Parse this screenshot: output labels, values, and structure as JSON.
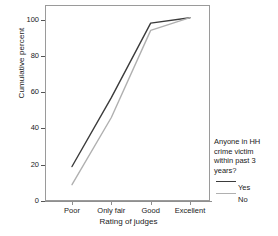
{
  "chart_data": {
    "type": "line",
    "title": "",
    "subtitle": "",
    "xlabel": "Rating of judges",
    "ylabel": "Cumulative percent",
    "categories": [
      "Poor",
      "Only fair",
      "Good",
      "Excellent"
    ],
    "series": [
      {
        "name": "Yes",
        "values": [
          19,
          57,
          98,
          101
        ],
        "color": "#3b3b3b"
      },
      {
        "name": "No",
        "values": [
          9,
          46,
          94,
          101
        ],
        "color": "#b0b0b0"
      }
    ],
    "ylim": [
      0,
      108
    ],
    "yticks": [
      0,
      20,
      40,
      60,
      80,
      100
    ],
    "ytick_labels": [
      "0",
      "20",
      "40",
      "60",
      "80",
      "100"
    ],
    "xlim": [
      0,
      3
    ],
    "grid": false,
    "legend_position": "right",
    "legend": {
      "title": "Anyone in HH\ncrime victim\nwithin past 3\nyears?",
      "entries": [
        "Yes",
        "No"
      ]
    }
  },
  "axis": {
    "y_title": "Cumulative percent",
    "x_title": "Rating of judges",
    "y_ticks": [
      {
        "label": "100",
        "value": 100
      },
      {
        "label": "80",
        "value": 80
      },
      {
        "label": "60",
        "value": 60
      },
      {
        "label": "40",
        "value": 40
      },
      {
        "label": "20",
        "value": 20
      },
      {
        "label": "0",
        "value": 0
      }
    ],
    "x_ticks": [
      {
        "label": "Poor"
      },
      {
        "label": "Only fair"
      },
      {
        "label": "Good"
      },
      {
        "label": "Excellent"
      }
    ]
  },
  "legend": {
    "title": "Anyone in HH\ncrime victim\nwithin past 3\nyears?",
    "items": [
      {
        "label": "Yes",
        "color": "#3b3b3b"
      },
      {
        "label": "No",
        "color": "#b0b0b0"
      }
    ]
  },
  "colors": {
    "series_yes": "#3b3b3b",
    "series_no": "#b0b0b0",
    "frame": "#9a9a9a",
    "text": "#1a1a1a",
    "background": "#ffffff"
  }
}
